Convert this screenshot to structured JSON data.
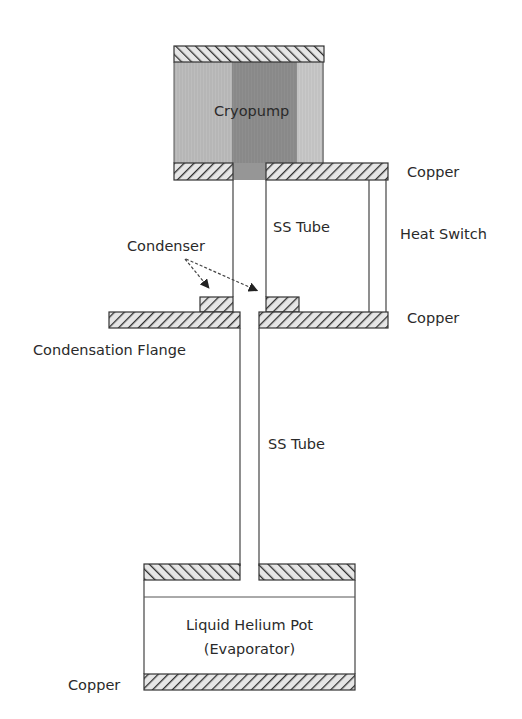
{
  "diagram": {
    "type": "cross-section schematic",
    "labels": {
      "cryopump": "Cryopump",
      "copper_top": "Copper",
      "ss_tube_upper": "SS Tube",
      "heat_switch": "Heat Switch",
      "condenser": "Condenser",
      "copper_mid": "Copper",
      "condensation_flange": "Condensation Flange",
      "ss_tube_lower": "SS Tube",
      "pot_line1": "Liquid Helium Pot",
      "pot_line2": "(Evaporator)",
      "copper_bottom": "Copper"
    },
    "colors": {
      "outline": "#3a3a3a",
      "cryopump_light": "#b8b8b8",
      "cryopump_dark": "#8f8f8f",
      "hatch_fill": "#e8e8e8",
      "arrow": "#555555"
    }
  }
}
